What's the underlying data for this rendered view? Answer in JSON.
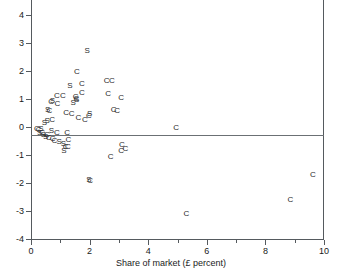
{
  "chart_data": {
    "type": "scatter",
    "title": "",
    "xlabel": "Share of market (£ percent)",
    "ylabel": "",
    "xlim": [
      0,
      10
    ],
    "ylim": [
      -4,
      5
    ],
    "xticks": [
      0,
      2,
      4,
      6,
      8,
      10
    ],
    "xtick_labels": [
      "0",
      "2",
      "4",
      "6",
      "8",
      "10"
    ],
    "xticks_minor": [
      1,
      3,
      5,
      7,
      9
    ],
    "yticks": [
      -4,
      -3,
      -2,
      -1,
      0,
      1,
      2,
      3,
      4,
      5
    ],
    "ytick_labels": [
      "-4",
      "-3",
      "-2",
      "-1",
      "0",
      "1",
      "2",
      "3",
      "4",
      "5"
    ],
    "grid": false,
    "legend": "none",
    "marker_style": "text-letter",
    "reference_lines": [
      {
        "axis": "y",
        "value": 0
      }
    ],
    "series": [
      {
        "name": "S",
        "marker_label": "S",
        "points": [
          [
            0.97,
            4.72
          ],
          [
            1.92,
            2.73
          ],
          [
            1.33,
            1.46
          ],
          [
            0.73,
            0.93
          ],
          [
            1.56,
            0.96
          ],
          [
            1.44,
            0.86
          ],
          [
            0.57,
            0.62
          ],
          [
            0.55,
            0.22
          ],
          [
            2.0,
            0.48
          ],
          [
            0.46,
            0.14
          ],
          [
            0.34,
            -0.07
          ],
          [
            0.7,
            -0.14
          ],
          [
            0.96,
            -0.55
          ],
          [
            1.11,
            -0.62
          ],
          [
            1.12,
            -0.84
          ],
          [
            0.42,
            -0.3
          ],
          [
            0.5,
            -0.36
          ],
          [
            0.3,
            -0.2
          ],
          [
            1.98,
            -1.88
          ]
        ]
      },
      {
        "name": "C",
        "marker_label": "C",
        "points": [
          [
            1.57,
            1.98
          ],
          [
            1.74,
            1.52
          ],
          [
            2.58,
            1.66
          ],
          [
            2.76,
            1.64
          ],
          [
            0.88,
            1.1
          ],
          [
            1.09,
            1.1
          ],
          [
            1.52,
            1.06
          ],
          [
            1.55,
            1.01
          ],
          [
            2.63,
            1.18
          ],
          [
            3.08,
            1.04
          ],
          [
            0.69,
            0.88
          ],
          [
            0.9,
            0.82
          ],
          [
            1.74,
            1.2
          ],
          [
            0.63,
            0.57
          ],
          [
            1.2,
            0.5
          ],
          [
            1.39,
            0.47
          ],
          [
            2.82,
            0.62
          ],
          [
            2.94,
            0.58
          ],
          [
            0.72,
            0.24
          ],
          [
            1.62,
            0.33
          ],
          [
            1.84,
            0.26
          ],
          [
            1.98,
            0.38
          ],
          [
            0.88,
            -0.22
          ],
          [
            1.23,
            -0.2
          ],
          [
            1.28,
            -0.48
          ],
          [
            0.55,
            -0.3
          ],
          [
            0.6,
            -0.4
          ],
          [
            0.38,
            -0.2
          ],
          [
            0.26,
            -0.12
          ],
          [
            0.2,
            -0.06
          ],
          [
            1.26,
            -0.72
          ],
          [
            1.18,
            -0.7
          ],
          [
            0.74,
            -0.44
          ],
          [
            0.8,
            -0.5
          ],
          [
            2.02,
            -1.92
          ],
          [
            2.72,
            -1.08
          ],
          [
            3.08,
            -0.86
          ],
          [
            3.22,
            -0.78
          ],
          [
            3.1,
            -0.66
          ],
          [
            4.95,
            -0.05
          ],
          [
            5.3,
            -3.12
          ],
          [
            8.85,
            -2.62
          ],
          [
            9.62,
            -1.72
          ]
        ]
      }
    ]
  }
}
